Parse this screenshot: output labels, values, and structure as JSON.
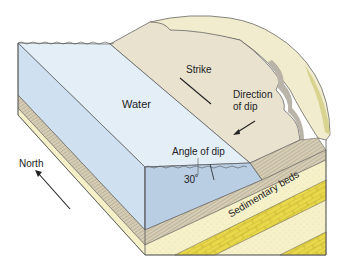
{
  "labels": {
    "water": "Water",
    "strike": "Strike",
    "direction_of_dip_line1": "Direction",
    "direction_of_dip_line2": "of dip",
    "angle_of_dip": "Angle of dip",
    "angle_value": "30˚",
    "north": "North",
    "sedimentary_beds": "Sedimentary beds"
  },
  "colors": {
    "water_surface": "#e4eef7",
    "water_front": "#b9cde3",
    "water_side": "#cfe0f0",
    "land_surface": "#e9e2cf",
    "rim_top": "#f1eccd",
    "rock_scarp": "#b9b4a7",
    "striated_bed": "#d6cdb6",
    "sand_bed": "#f6f1c8",
    "yellow_bed": "#e8d84a",
    "outline": "#555555"
  }
}
